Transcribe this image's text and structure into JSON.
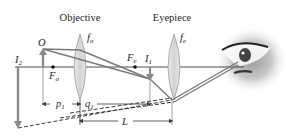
{
  "diagram": {
    "type": "compound-microscope-ray-diagram",
    "labels": {
      "objective": "Objective",
      "eyepiece": "Eyepiece",
      "object": "O",
      "objective_focal": "f",
      "objective_focal_sub": "o",
      "eyepiece_focal": "f",
      "eyepiece_focal_sub": "e",
      "focal_point_objective": "F",
      "focal_point_objective_sub": "o",
      "focal_point_eyepiece": "F",
      "focal_point_eyepiece_sub": "e",
      "image1": "I",
      "image1_sub": "1",
      "image2": "I",
      "image2_sub": "2",
      "p1": "p",
      "p1_sub": "1",
      "q1": "q",
      "q1_sub": "1",
      "L": "L"
    },
    "colors": {
      "axis": "#3a3a3a",
      "lens_fill": "#dcdcdc",
      "lens_stroke": "#9a9a9a",
      "ray": "#7a7a7a",
      "arrow": "#8a8a8a",
      "text": "#1e1e1e"
    }
  }
}
